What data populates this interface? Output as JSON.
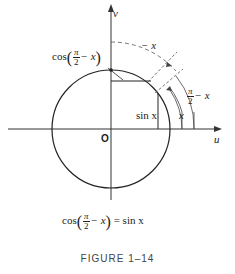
{
  "figure": {
    "caption": "FIGURE 1–14",
    "axes": {
      "x_label": "u",
      "y_label": "v",
      "origin_label": "O"
    },
    "labels": {
      "cos_label_prefix": "cos",
      "pi": "π",
      "two": "2",
      "minus_x": "− x",
      "sin_x": "sin x",
      "arc_minus_x": "− x",
      "arc_pi_over_2_num": "π",
      "arc_pi_over_2_den": "2",
      "arc_pi_minus_x": "− x",
      "arc_x": "x"
    },
    "identity": {
      "lhs_prefix": "cos",
      "pi": "π",
      "two": "2",
      "minus_x": "− x",
      "rhs": "= sin  x"
    },
    "colors": {
      "stroke": "#222222",
      "dashed": "#555555",
      "axis": "#333333"
    }
  }
}
